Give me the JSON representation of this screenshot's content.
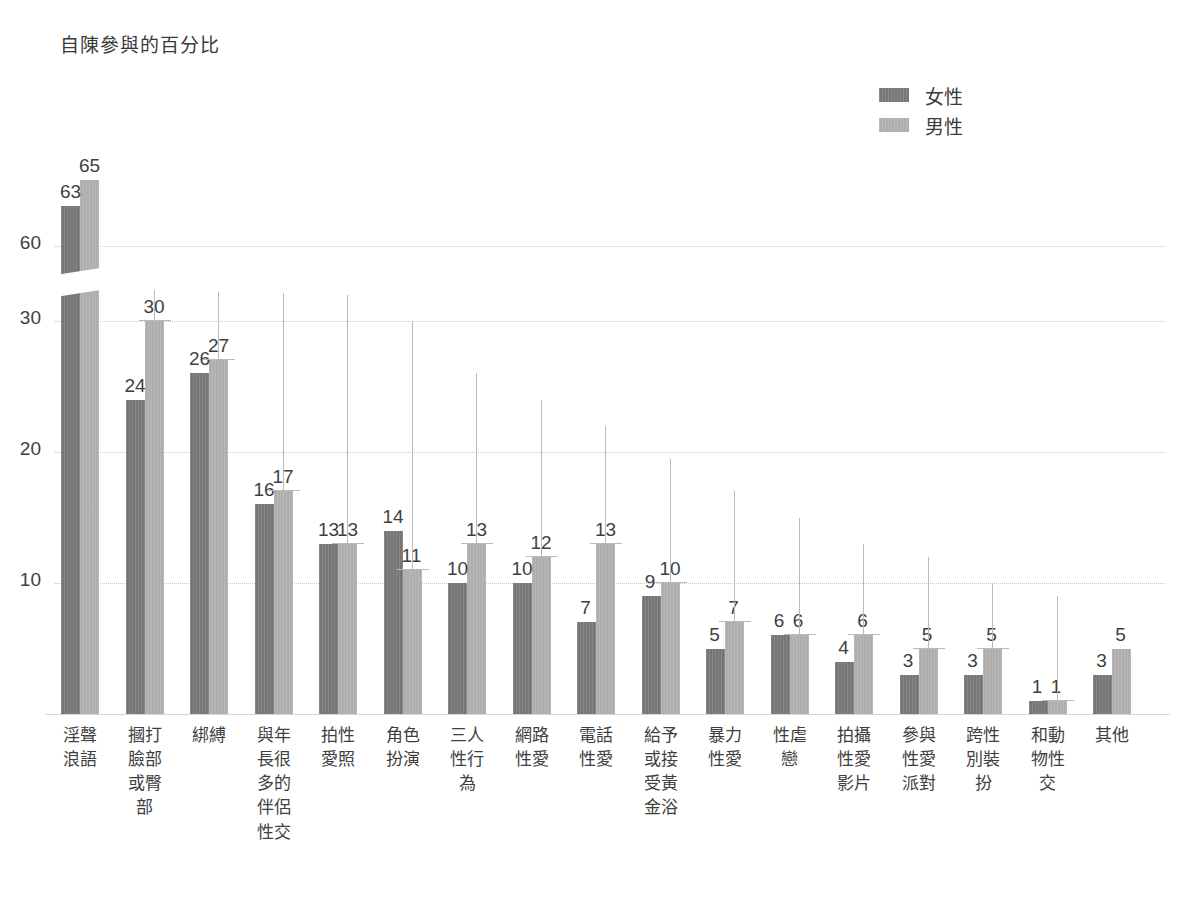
{
  "chart_data": {
    "type": "bar",
    "title": "自陳參與的百分比",
    "xlabel": "",
    "ylabel": "自陳參與的百分比",
    "ylim": [
      0,
      68
    ],
    "grid": true,
    "axis_break": {
      "from": 32,
      "to": 57,
      "note": "y-axis broken between 30 and 60"
    },
    "legend": {
      "position": "top-right",
      "entries": [
        "女性",
        "男性"
      ]
    },
    "yticks": [
      10,
      20,
      30,
      60
    ],
    "ytick_labels": [
      "10",
      "20",
      "30",
      "60"
    ],
    "categories": [
      "淫聲浪語",
      "摑打臉部或臀部",
      "綁縛",
      "與年長很多的伴侶性交",
      "拍性愛照",
      "角色扮演",
      "三人性行為",
      "網路性愛",
      "電話性愛",
      "給予或接受黃金浴",
      "暴力性愛",
      "性虐戀",
      "拍攝性愛影片",
      "參與性愛派對",
      "跨性別裝扮",
      "和動物性交",
      "其他"
    ],
    "category_lines": [
      [
        "淫聲",
        "浪語"
      ],
      [
        "摑打",
        "臉部",
        "或臀",
        "部"
      ],
      [
        "綁縛"
      ],
      [
        "與年",
        "長很",
        "多的",
        "伴侶",
        "性交"
      ],
      [
        "拍性",
        "愛照"
      ],
      [
        "角色",
        "扮演"
      ],
      [
        "三人",
        "性行",
        "為"
      ],
      [
        "網路",
        "性愛"
      ],
      [
        "電話",
        "性愛"
      ],
      [
        "給予",
        "或接",
        "受黃",
        "金浴"
      ],
      [
        "暴力",
        "性愛"
      ],
      [
        "性虐",
        "戀"
      ],
      [
        "拍攝",
        "性愛",
        "影片"
      ],
      [
        "參與",
        "性愛",
        "派對"
      ],
      [
        "跨性",
        "別裝",
        "扮"
      ],
      [
        "和動",
        "物性",
        "交"
      ],
      [
        "其他"
      ]
    ],
    "series": [
      {
        "name": "女性",
        "color": "#767676",
        "values": [
          63,
          24,
          26,
          16,
          13,
          14,
          10,
          10,
          7,
          9,
          5,
          6,
          4,
          3,
          3,
          1,
          3
        ]
      },
      {
        "name": "男性",
        "color": "#aeaeae",
        "values": [
          65,
          30,
          27,
          17,
          13,
          11,
          13,
          12,
          13,
          10,
          7,
          6,
          6,
          5,
          5,
          1,
          5
        ]
      }
    ],
    "error_bar_tops": [
      null,
      44,
      39,
      35.5,
      32,
      30,
      26,
      24,
      22,
      19.5,
      17,
      15,
      13,
      12,
      10,
      9,
      null
    ],
    "error_bar_note": "thin vertical whiskers with horizontal caps drawn above the 男性 bars"
  },
  "legend": {
    "female_label": "女性",
    "male_label": "男性"
  },
  "axis": {
    "title": "自陳參與的百分比",
    "ytick_60": "60",
    "ytick_30": "30",
    "ytick_20": "20",
    "ytick_10": "10"
  }
}
